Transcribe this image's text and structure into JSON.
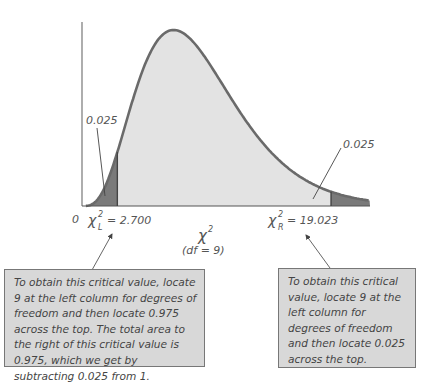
{
  "diagram": {
    "type": "chi-square distribution",
    "degrees_of_freedom": 9,
    "axis": {
      "origin_label": "0",
      "x_symbol": "χ",
      "x_superscript": "2",
      "df_label": "(df = 9)"
    },
    "left_tail": {
      "area_label": "0.025",
      "critical_symbol": "χ",
      "critical_sub": "L",
      "critical_sup": "2",
      "critical_value_text": "= 2.700",
      "critical_value": 2.7
    },
    "right_tail": {
      "area_label": "0.025",
      "critical_symbol": "χ",
      "critical_sub": "R",
      "critical_sup": "2",
      "critical_value_text": "= 19.023",
      "critical_value": 19.023
    },
    "callouts": {
      "left": "To obtain this critical value, locate 9 at the left column for degrees of freedom and then locate 0.975 across the top. The total area to the right of this critical value is 0.975, which we get by subtracting 0.025 from 1.",
      "right": "To obtain this critical value, locate 9 at the left column for degrees of freedom and then locate 0.025 across the top."
    },
    "colors": {
      "body_fill": "#e3e3e3",
      "tail_fill": "#7a7a7a",
      "curve_stroke": "#6a6a6a",
      "callout_bg": "#d8d8d8"
    }
  }
}
